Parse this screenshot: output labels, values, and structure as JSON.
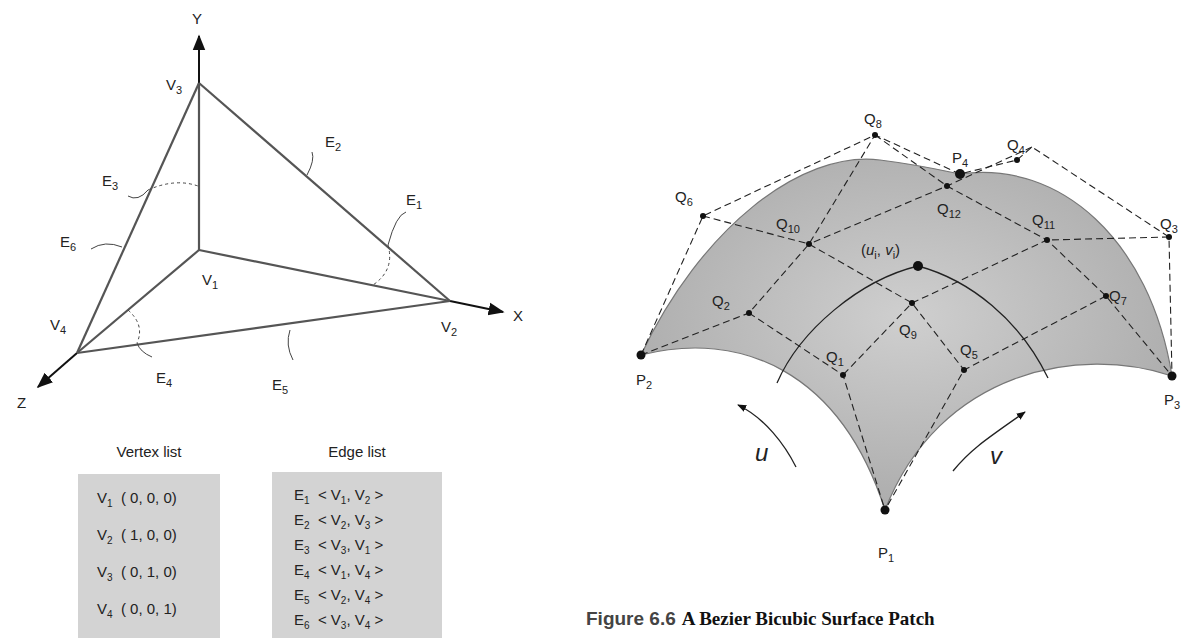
{
  "left_diagram": {
    "axes": {
      "x": "X",
      "y": "Y",
      "z": "Z"
    },
    "vertices": [
      {
        "name": "V",
        "sub": "1"
      },
      {
        "name": "V",
        "sub": "2"
      },
      {
        "name": "V",
        "sub": "3"
      },
      {
        "name": "V",
        "sub": "4"
      }
    ],
    "edges": [
      {
        "name": "E",
        "sub": "1"
      },
      {
        "name": "E",
        "sub": "2"
      },
      {
        "name": "E",
        "sub": "3"
      },
      {
        "name": "E",
        "sub": "4"
      },
      {
        "name": "E",
        "sub": "5"
      },
      {
        "name": "E",
        "sub": "6"
      }
    ]
  },
  "vertex_list": {
    "title": "Vertex list",
    "rows": [
      {
        "name": "V",
        "sub": "1",
        "coords": "( 0, 0, 0)"
      },
      {
        "name": "V",
        "sub": "2",
        "coords": "( 1, 0, 0)"
      },
      {
        "name": "V",
        "sub": "3",
        "coords": "( 0, 1, 0)"
      },
      {
        "name": "V",
        "sub": "4",
        "coords": "( 0, 0, 1)"
      }
    ]
  },
  "edge_list": {
    "title": "Edge list",
    "rows": [
      {
        "name": "E",
        "sub": "1",
        "a": "1",
        "b": "2"
      },
      {
        "name": "E",
        "sub": "2",
        "a": "2",
        "b": "3"
      },
      {
        "name": "E",
        "sub": "3",
        "a": "3",
        "b": "1"
      },
      {
        "name": "E",
        "sub": "4",
        "a": "1",
        "b": "4"
      },
      {
        "name": "E",
        "sub": "5",
        "a": "2",
        "b": "4"
      },
      {
        "name": "E",
        "sub": "6",
        "a": "3",
        "b": "4"
      }
    ]
  },
  "right_diagram": {
    "corner_points": [
      {
        "name": "P",
        "sub": "1"
      },
      {
        "name": "P",
        "sub": "2"
      },
      {
        "name": "P",
        "sub": "3"
      },
      {
        "name": "P",
        "sub": "4"
      }
    ],
    "control_points": [
      {
        "name": "Q",
        "sub": "1"
      },
      {
        "name": "Q",
        "sub": "2"
      },
      {
        "name": "Q",
        "sub": "3"
      },
      {
        "name": "Q",
        "sub": "4"
      },
      {
        "name": "Q",
        "sub": "5"
      },
      {
        "name": "Q",
        "sub": "6"
      },
      {
        "name": "Q",
        "sub": "7"
      },
      {
        "name": "Q",
        "sub": "8"
      },
      {
        "name": "Q",
        "sub": "9"
      },
      {
        "name": "Q",
        "sub": "10"
      },
      {
        "name": "Q",
        "sub": "11"
      },
      {
        "name": "Q",
        "sub": "12"
      }
    ],
    "param_point": {
      "u": "u",
      "v": "v",
      "sub": "i"
    },
    "direction_labels": {
      "u": "u",
      "v": "v"
    },
    "surface_color": "#bdbdbd"
  },
  "caption": {
    "number": "Figure 6.6",
    "text": "A Bezier Bicubic Surface Patch"
  }
}
